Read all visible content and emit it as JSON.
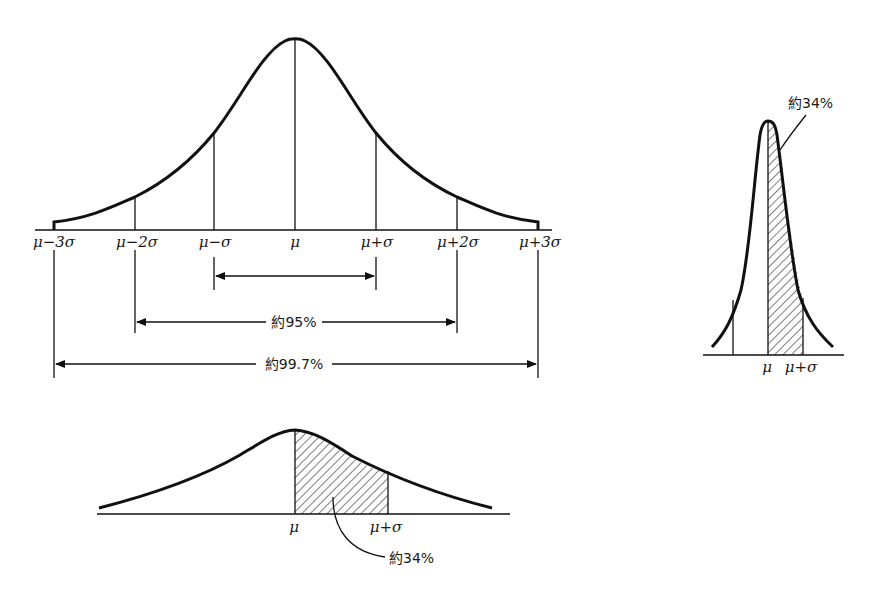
{
  "figure": {
    "main_curve": {
      "tick_labels": [
        "μ−3σ",
        "μ−2σ",
        "μ−σ",
        "μ",
        "μ+σ",
        "μ+2σ",
        "μ+3σ"
      ],
      "ranges": [
        {
          "from": "μ−σ",
          "to": "μ+σ",
          "label": ""
        },
        {
          "from": "μ−2σ",
          "to": "μ+2σ",
          "label": "約95%"
        },
        {
          "from": "μ−3σ",
          "to": "μ+3σ",
          "label": "約99.7%"
        }
      ]
    },
    "narrow_curve": {
      "tick_labels": [
        "μ",
        "μ+σ"
      ],
      "shaded_label": "約34%"
    },
    "wide_curve": {
      "tick_labels": [
        "μ",
        "μ+σ"
      ],
      "shaded_label": "約34%"
    }
  },
  "colors": {
    "line": "#111111",
    "background": "#ffffff"
  }
}
